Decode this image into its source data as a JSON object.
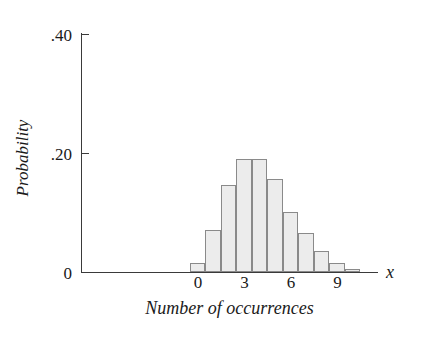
{
  "chart_data": {
    "type": "bar",
    "title": "",
    "subtitle": "",
    "xlabel": "Number of occurrences",
    "ylabel": "Probability",
    "x_variable_symbol": "x",
    "categories": [
      0,
      1,
      2,
      3,
      4,
      5,
      6,
      7,
      8,
      9,
      10
    ],
    "values": [
      0.015,
      0.07,
      0.145,
      0.19,
      0.19,
      0.155,
      0.1,
      0.065,
      0.035,
      0.015,
      0.005
    ],
    "series": [
      {
        "name": "Probability",
        "values": [
          0.015,
          0.07,
          0.145,
          0.19,
          0.19,
          0.155,
          0.1,
          0.065,
          0.035,
          0.015,
          0.005
        ]
      }
    ],
    "xlim": [
      -0.5,
      10.5
    ],
    "ylim": [
      0,
      0.4
    ],
    "y_ticks": [
      0,
      0.2,
      0.4
    ],
    "y_tick_labels": [
      "0",
      ".20",
      ".40"
    ],
    "x_ticks": [
      0,
      3,
      6,
      9
    ],
    "x_tick_labels": [
      "0",
      "3",
      "6",
      "9"
    ],
    "grid": false,
    "legend": false,
    "legend_position": "none",
    "bar_fill_color": "#ececec",
    "bar_edge_color": "#8a8a8a",
    "axis_color": "#3a3a3a",
    "text_color": "#1a1a1a",
    "background_color": "#ffffff"
  }
}
